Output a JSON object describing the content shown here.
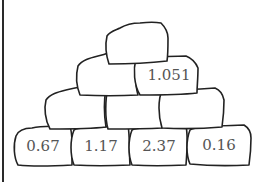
{
  "diagram": {
    "type": "number-pyramid",
    "rows": [
      {
        "row": 1,
        "stones": [
          {
            "value": ""
          }
        ]
      },
      {
        "row": 2,
        "stones": [
          {
            "value": ""
          },
          {
            "value": "1.051"
          }
        ]
      },
      {
        "row": 3,
        "stones": [
          {
            "value": ""
          },
          {
            "value": ""
          },
          {
            "value": ""
          }
        ]
      },
      {
        "row": 4,
        "stones": [
          {
            "value": "0.67"
          },
          {
            "value": "1.17"
          },
          {
            "value": "2.37"
          },
          {
            "value": "0.16"
          }
        ]
      }
    ],
    "colors": {
      "stroke": "#222222",
      "fill": "#ffffff",
      "text": "#555555",
      "border": "#2a2a2a"
    }
  }
}
